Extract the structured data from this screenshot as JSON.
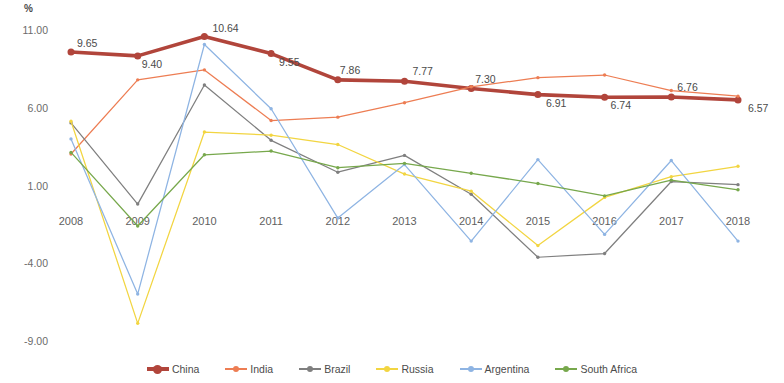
{
  "chart_data": {
    "type": "line",
    "title": "",
    "subtitle": "",
    "xlabel": "",
    "ylabel": "%",
    "unit_label": "%",
    "categories": [
      "2008",
      "2009",
      "2010",
      "2011",
      "2012",
      "2013",
      "2014",
      "2015",
      "2016",
      "2017",
      "2018"
    ],
    "ylim": [
      -9.0,
      11.0
    ],
    "yticks": [
      "11.00",
      "6.00",
      "1.00",
      "-4.00",
      "-9.00"
    ],
    "ytick_values": [
      11.0,
      6.0,
      1.0,
      -4.0,
      -9.0
    ],
    "grid": false,
    "legend_position": "bottom",
    "series": [
      {
        "name": "China",
        "color": "#B1453B",
        "emphasis": true,
        "values": [
          9.65,
          9.4,
          10.64,
          9.55,
          7.86,
          7.77,
          7.3,
          6.91,
          6.74,
          6.76,
          6.57
        ],
        "labels": [
          "9.65",
          "9.40",
          "10.64",
          "9.55",
          "7.86",
          "7.77",
          "7.30",
          "6.91",
          "6.74",
          "6.76",
          "6.57"
        ]
      },
      {
        "name": "India",
        "color": "#ED7D53",
        "emphasis": false,
        "values": [
          3.09,
          7.86,
          8.5,
          5.24,
          5.46,
          6.39,
          7.41,
          8.0,
          8.17,
          7.17,
          6.81
        ]
      },
      {
        "name": "Brazil",
        "color": "#7F7F7F",
        "emphasis": false,
        "values": [
          5.09,
          -0.13,
          7.53,
          3.97,
          1.92,
          3.0,
          0.5,
          -3.55,
          -3.31,
          1.32,
          1.12
        ]
      },
      {
        "name": "Russia",
        "color": "#F2D541",
        "emphasis": false,
        "values": [
          5.2,
          -7.8,
          4.5,
          4.3,
          3.7,
          1.8,
          0.7,
          -2.8,
          0.3,
          1.63,
          2.3
        ]
      },
      {
        "name": "Argentina",
        "color": "#8EB4E3",
        "emphasis": false,
        "values": [
          4.06,
          -5.92,
          10.13,
          6.0,
          -1.03,
          2.41,
          -2.51,
          2.73,
          -2.08,
          2.67,
          -2.51
        ]
      },
      {
        "name": "South Africa",
        "color": "#77A84C",
        "emphasis": false,
        "values": [
          3.19,
          -1.54,
          3.04,
          3.28,
          2.21,
          2.49,
          1.85,
          1.19,
          0.4,
          1.41,
          0.79
        ]
      }
    ]
  },
  "legend": {
    "items": [
      {
        "label": "China"
      },
      {
        "label": "India"
      },
      {
        "label": "Brazil"
      },
      {
        "label": "Russia"
      },
      {
        "label": "Argentina"
      },
      {
        "label": "South Africa"
      }
    ]
  }
}
